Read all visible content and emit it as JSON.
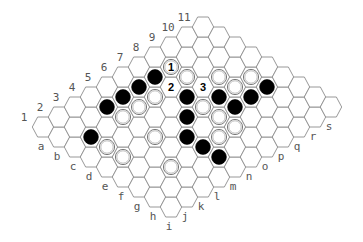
{
  "game": {
    "name": "Hex",
    "board": {
      "number_labels": [
        "1",
        "2",
        "3",
        "4",
        "5",
        "6",
        "7",
        "8",
        "9",
        "10",
        "11"
      ],
      "letter_labels": [
        "a",
        "b",
        "c",
        "d",
        "e",
        "f",
        "g",
        "h",
        "i",
        "j",
        "k",
        "l",
        "m",
        "n",
        "o",
        "p",
        "q",
        "r",
        "s"
      ],
      "rows": 11,
      "cols": 9,
      "colors": {
        "black_stone": "#000000",
        "white_stone": "#ffffff",
        "grid_line": "#8c8c8c",
        "label": "#555555"
      }
    },
    "stones": {
      "black": [
        [
          6,
          1
        ],
        [
          5,
          1
        ],
        [
          4,
          1
        ],
        [
          3,
          1
        ],
        [
          1,
          2
        ],
        [
          6,
          3
        ],
        [
          5,
          4
        ],
        [
          4,
          5
        ],
        [
          4,
          6
        ],
        [
          4,
          7
        ],
        [
          7,
          4
        ],
        [
          7,
          5
        ],
        [
          8,
          5
        ],
        [
          9,
          5
        ]
      ],
      "white": [
        [
          7,
          1
        ],
        [
          5,
          2
        ],
        [
          7,
          2
        ],
        [
          4,
          2
        ],
        [
          3,
          2
        ],
        [
          1,
          3
        ],
        [
          1,
          4
        ],
        [
          3,
          4
        ],
        [
          8,
          3
        ],
        [
          9,
          4
        ],
        [
          8,
          4
        ],
        [
          6,
          4
        ],
        [
          6,
          5
        ],
        [
          6,
          6
        ],
        [
          5,
          6
        ],
        [
          2,
          6
        ]
      ]
    },
    "move_markers": [
      {
        "cell": [
          7,
          1
        ],
        "label": "1",
        "on_stone": "white"
      },
      {
        "cell": [
          6,
          2
        ],
        "label": "2",
        "on_stone": "none"
      },
      {
        "cell": [
          7,
          3
        ],
        "label": "3",
        "on_stone": "none"
      }
    ]
  }
}
